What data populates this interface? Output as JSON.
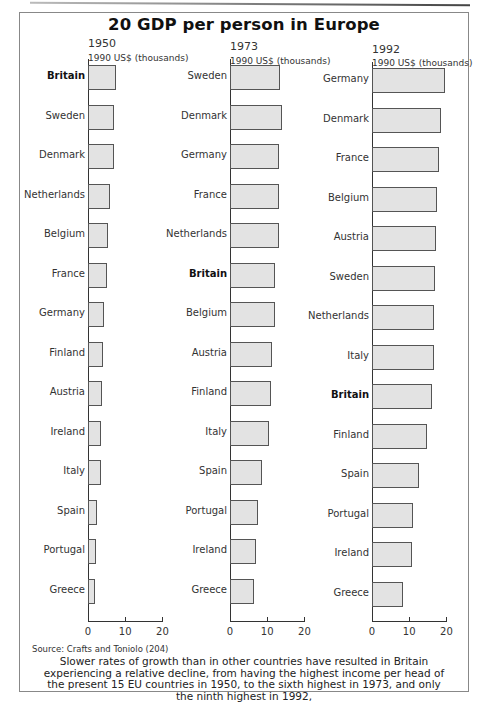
{
  "title": "20 GDP per person in Europe",
  "panels": [
    {
      "year": "1950",
      "unit": "1990 US$ (thousands)",
      "categories": [
        "Britain",
        "Sweden",
        "Denmark",
        "Netherlands",
        "Belgium",
        "France",
        "Germany",
        "Finland",
        "Austria",
        "Ireland",
        "Italy",
        "Spain",
        "Portugal",
        "Greece"
      ],
      "values": [
        7.4,
        7.1,
        7.0,
        6.0,
        5.3,
        5.2,
        4.3,
        4.1,
        3.7,
        3.4,
        3.4,
        2.4,
        2.1,
        1.9
      ],
      "ticks": [
        "0",
        "10",
        "20"
      ]
    },
    {
      "year": "1973",
      "unit": "1990 US$ (thousands)",
      "categories": [
        "Sweden",
        "Denmark",
        "Germany",
        "France",
        "Netherlands",
        "Britain",
        "Belgium",
        "Austria",
        "Finland",
        "Italy",
        "Spain",
        "Portugal",
        "Ireland",
        "Greece"
      ],
      "values": [
        13.5,
        13.9,
        13.2,
        13.1,
        13.1,
        12.0,
        12.2,
        11.2,
        11.1,
        10.6,
        8.7,
        7.6,
        7.0,
        6.4
      ],
      "ticks": [
        "0",
        "10",
        "20"
      ]
    },
    {
      "year": "1992",
      "unit": "1990 US$ (thousands)",
      "categories": [
        "Germany",
        "Denmark",
        "France",
        "Belgium",
        "Austria",
        "Sweden",
        "Netherlands",
        "Italy",
        "Britain",
        "Finland",
        "Spain",
        "Portugal",
        "Ireland",
        "Greece"
      ],
      "values": [
        19.5,
        18.6,
        18.1,
        17.4,
        17.3,
        16.9,
        16.8,
        16.6,
        16.2,
        14.8,
        12.7,
        11.1,
        10.7,
        8.2
      ],
      "ticks": [
        "0",
        "10",
        "20"
      ]
    }
  ],
  "highlight": "Britain",
  "colors": {
    "bar_fill": "#e3e3e3",
    "bar_stroke": "#555555",
    "axis": "#333333"
  },
  "source": "Source: Crafts and Toniolo (204)",
  "caption": "Slower rates of growth than in other countries have resulted in Britain experiencing a relative decline, from having the highest income per head of the present 15 EU countries in 1950, to the sixth highest in 1973, and only the ninth highest in 1992,",
  "chart_data": [
    {
      "type": "bar",
      "orientation": "horizontal",
      "title": "20 GDP per person in Europe — 1950",
      "xlabel": "1990 US$ (thousands)",
      "ylabel": "",
      "xlim": [
        0,
        20
      ],
      "x_ticks": [
        0,
        10,
        20
      ],
      "grid": false,
      "categories": [
        "Britain",
        "Sweden",
        "Denmark",
        "Netherlands",
        "Belgium",
        "France",
        "Germany",
        "Finland",
        "Austria",
        "Ireland",
        "Italy",
        "Spain",
        "Portugal",
        "Greece"
      ],
      "values": [
        7.4,
        7.1,
        7.0,
        6.0,
        5.3,
        5.2,
        4.3,
        4.1,
        3.7,
        3.4,
        3.4,
        2.4,
        2.1,
        1.9
      ],
      "highlighted_category": "Britain"
    },
    {
      "type": "bar",
      "orientation": "horizontal",
      "title": "20 GDP per person in Europe — 1973",
      "xlabel": "1990 US$ (thousands)",
      "ylabel": "",
      "xlim": [
        0,
        20
      ],
      "x_ticks": [
        0,
        10,
        20
      ],
      "grid": false,
      "categories": [
        "Sweden",
        "Denmark",
        "Germany",
        "France",
        "Netherlands",
        "Britain",
        "Belgium",
        "Austria",
        "Finland",
        "Italy",
        "Spain",
        "Portugal",
        "Ireland",
        "Greece"
      ],
      "values": [
        13.5,
        13.9,
        13.2,
        13.1,
        13.1,
        12.0,
        12.2,
        11.2,
        11.1,
        10.6,
        8.7,
        7.6,
        7.0,
        6.4
      ],
      "highlighted_category": "Britain"
    },
    {
      "type": "bar",
      "orientation": "horizontal",
      "title": "20 GDP per person in Europe — 1992",
      "xlabel": "1990 US$ (thousands)",
      "ylabel": "",
      "xlim": [
        0,
        20
      ],
      "x_ticks": [
        0,
        10,
        20
      ],
      "grid": false,
      "categories": [
        "Germany",
        "Denmark",
        "France",
        "Belgium",
        "Austria",
        "Sweden",
        "Netherlands",
        "Italy",
        "Britain",
        "Finland",
        "Spain",
        "Portugal",
        "Ireland",
        "Greece"
      ],
      "values": [
        19.5,
        18.6,
        18.1,
        17.4,
        17.3,
        16.9,
        16.8,
        16.6,
        16.2,
        14.8,
        12.7,
        11.1,
        10.7,
        8.2
      ],
      "highlighted_category": "Britain"
    }
  ]
}
